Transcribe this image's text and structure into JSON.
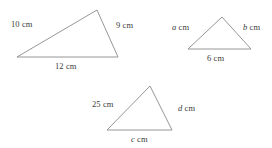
{
  "figure": {
    "type": "geometry-diagram",
    "background_color": "#ffffff",
    "stroke_color": "#8a8a8a",
    "text_color": "#3b3b3b",
    "unit": "cm",
    "triangles": [
      {
        "id": "triangle-1",
        "vertices": {
          "apex": [
            97,
            10
          ],
          "base_left": [
            17,
            57
          ],
          "base_right": [
            118,
            57
          ]
        },
        "labels": {
          "left_side": "10 cm",
          "right_side": "9 cm",
          "base": "12 cm"
        },
        "values": {
          "left_side": 10,
          "right_side": 9,
          "base": 12
        }
      },
      {
        "id": "triangle-2",
        "vertices": {
          "apex": [
            222,
            17
          ],
          "base_left": [
            188,
            49
          ],
          "base_right": [
            251,
            49
          ]
        },
        "labels": {
          "left_side_var": "a",
          "left_side_unit": " cm",
          "right_side_var": "b",
          "right_side_unit": " cm",
          "base": "6 cm"
        },
        "values": {
          "left_side": null,
          "right_side": null,
          "base": 6
        }
      },
      {
        "id": "triangle-3",
        "vertices": {
          "apex": [
            150,
            86
          ],
          "base_left": [
            107,
            130
          ],
          "base_right": [
            172,
            130
          ]
        },
        "labels": {
          "left_side": "25 cm",
          "right_side_var": "d",
          "right_side_unit": " cm",
          "base_var": "c",
          "base_unit": " cm"
        },
        "values": {
          "left_side": 25,
          "right_side": null,
          "base": null
        }
      }
    ]
  }
}
